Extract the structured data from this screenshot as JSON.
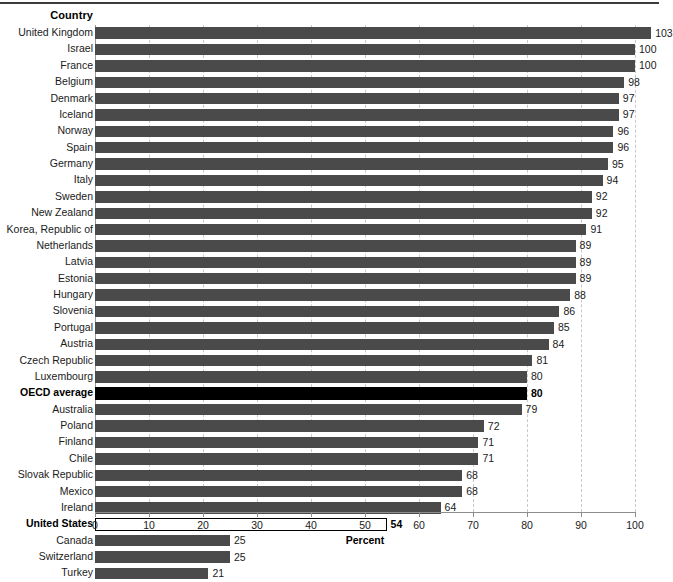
{
  "chart_data": {
    "type": "bar",
    "orientation": "horizontal",
    "title": "",
    "xlabel": "Percent",
    "ylabel": "Country",
    "xlim": [
      0,
      100
    ],
    "xticks": [
      0,
      10,
      20,
      30,
      40,
      50,
      60,
      70,
      80,
      90,
      100
    ],
    "grid": true,
    "legend": null,
    "column_header": "Country",
    "categories": [
      "United Kingdom",
      "Israel",
      "France",
      "Belgium",
      "Denmark",
      "Iceland",
      "Norway",
      "Spain",
      "Germany",
      "Italy",
      "Sweden",
      "New Zealand",
      "Korea, Republic of",
      "Netherlands",
      "Latvia",
      "Estonia",
      "Hungary",
      "Slovenia",
      "Portugal",
      "Austria",
      "Czech Republic",
      "Luxembourg",
      "OECD average",
      "Australia",
      "Poland",
      "Finland",
      "Chile",
      "Slovak Republic",
      "Mexico",
      "Ireland",
      "United States",
      "Canada",
      "Switzerland",
      "Turkey"
    ],
    "values": [
      103,
      100,
      100,
      98,
      97,
      97,
      96,
      96,
      95,
      94,
      92,
      92,
      91,
      89,
      89,
      89,
      88,
      86,
      85,
      84,
      81,
      80,
      80,
      79,
      72,
      71,
      71,
      68,
      68,
      64,
      54,
      25,
      25,
      21
    ],
    "bars": [
      {
        "label": "United Kingdom",
        "value": 103,
        "style": "filled"
      },
      {
        "label": "Israel",
        "value": 100,
        "style": "filled"
      },
      {
        "label": "France",
        "value": 100,
        "style": "filled"
      },
      {
        "label": "Belgium",
        "value": 98,
        "style": "filled"
      },
      {
        "label": "Denmark",
        "value": 97,
        "style": "filled"
      },
      {
        "label": "Iceland",
        "value": 97,
        "style": "filled"
      },
      {
        "label": "Norway",
        "value": 96,
        "style": "filled"
      },
      {
        "label": "Spain",
        "value": 96,
        "style": "filled"
      },
      {
        "label": "Germany",
        "value": 95,
        "style": "filled"
      },
      {
        "label": "Italy",
        "value": 94,
        "style": "filled"
      },
      {
        "label": "Sweden",
        "value": 92,
        "style": "filled"
      },
      {
        "label": "New Zealand",
        "value": 92,
        "style": "filled"
      },
      {
        "label": "Korea, Republic of",
        "value": 91,
        "style": "filled"
      },
      {
        "label": "Netherlands",
        "value": 89,
        "style": "filled"
      },
      {
        "label": "Latvia",
        "value": 89,
        "style": "filled"
      },
      {
        "label": "Estonia",
        "value": 89,
        "style": "filled"
      },
      {
        "label": "Hungary",
        "value": 88,
        "style": "filled"
      },
      {
        "label": "Slovenia",
        "value": 86,
        "style": "filled"
      },
      {
        "label": "Portugal",
        "value": 85,
        "style": "filled"
      },
      {
        "label": "Austria",
        "value": 84,
        "style": "filled"
      },
      {
        "label": "Czech Republic",
        "value": 81,
        "style": "filled"
      },
      {
        "label": "Luxembourg",
        "value": 80,
        "style": "filled"
      },
      {
        "label": "OECD average",
        "value": 80,
        "style": "black"
      },
      {
        "label": "Australia",
        "value": 79,
        "style": "filled"
      },
      {
        "label": "Poland",
        "value": 72,
        "style": "filled"
      },
      {
        "label": "Finland",
        "value": 71,
        "style": "filled"
      },
      {
        "label": "Chile",
        "value": 71,
        "style": "filled"
      },
      {
        "label": "Slovak Republic",
        "value": 68,
        "style": "filled"
      },
      {
        "label": "Mexico",
        "value": 68,
        "style": "filled"
      },
      {
        "label": "Ireland",
        "value": 64,
        "style": "filled"
      },
      {
        "label": "United States",
        "value": 54,
        "style": "hollow"
      },
      {
        "label": "Canada",
        "value": 25,
        "style": "filled"
      },
      {
        "label": "Switzerland",
        "value": 25,
        "style": "filled"
      },
      {
        "label": "Turkey",
        "value": 21,
        "style": "filled"
      }
    ]
  },
  "colors": {
    "bar_fill": "#4a4a4a",
    "bar_highlight": "#000000",
    "bar_hollow_fill": "#ffffff",
    "bar_hollow_stroke": "#000000",
    "gridline": "#c9c9c9",
    "axis": "#8d8d8d",
    "rule": "#3b3b3b",
    "text": "#1a1a1a",
    "background": "#ffffff"
  }
}
